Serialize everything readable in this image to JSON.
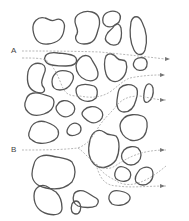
{
  "figure": {
    "labels": {
      "a": "A",
      "b": "B"
    },
    "colors": {
      "grain_outline": "#555555",
      "flow_path": "#999999",
      "arrow": "#777777",
      "background": "#ffffff"
    },
    "flow_paths": {
      "count": 6,
      "inlets": [
        "A",
        "B"
      ],
      "outlet_arrows": 5
    }
  }
}
